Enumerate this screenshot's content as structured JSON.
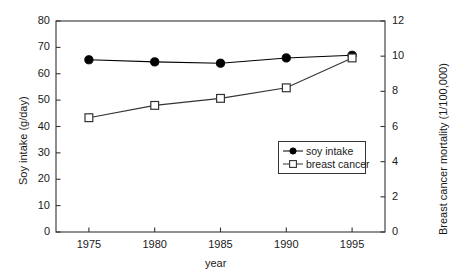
{
  "chart_data": {
    "type": "line",
    "title": "",
    "xlabel": "year",
    "ylabel": "Soy intake (g/day)",
    "ylabel_right": "Breast cancer mortality (1/100,000)",
    "x": [
      1975,
      1980,
      1985,
      1990,
      1995
    ],
    "xlim": [
      1972.5,
      1997.5
    ],
    "xticks": [
      "1975",
      "1980",
      "1985",
      "1990",
      "1995"
    ],
    "ylim": [
      0,
      80
    ],
    "yticks": [
      "0",
      "10",
      "20",
      "30",
      "40",
      "50",
      "60",
      "70",
      "80"
    ],
    "ylim_right": [
      0,
      12
    ],
    "yticks_right": [
      "0",
      "2",
      "4",
      "6",
      "8",
      "10",
      "12"
    ],
    "grid": false,
    "legend_position": "center-right",
    "series": [
      {
        "name": "soy intake",
        "axis": "left",
        "marker": "filled-circle",
        "values": [
          65.3,
          64.5,
          64.0,
          66.0,
          67.0
        ]
      },
      {
        "name": "breast cancer",
        "axis": "right",
        "marker": "open-square",
        "values": [
          6.5,
          7.2,
          7.6,
          8.2,
          9.9
        ]
      }
    ]
  },
  "legend": {
    "items": [
      {
        "label": "soy intake",
        "marker": "filled-circle"
      },
      {
        "label": "breast cancer",
        "marker": "open-square"
      }
    ]
  },
  "colors": {
    "axis": "#333333",
    "series_soy": "#000000",
    "series_breast": "#333333",
    "background": "#ffffff"
  }
}
